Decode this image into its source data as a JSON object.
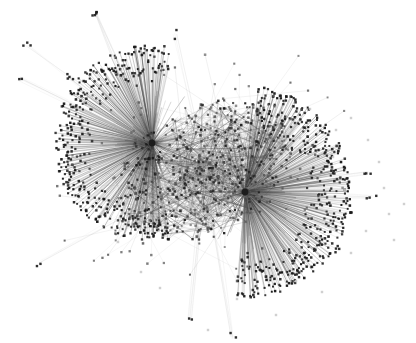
{
  "figure": {
    "name": "network-graph-visualization",
    "type": "force-directed-node-link-graph",
    "width": 416,
    "height": 343,
    "background_color": "#ffffff",
    "title": "",
    "caption": "",
    "axis_visible": false,
    "legend_visible": false,
    "labels_visible": false
  },
  "style": {
    "node_shape": "square",
    "node_color_core": "#1a1a1a",
    "node_color_mid": "#555555",
    "node_color_faint": "#c8c8c8",
    "edge_color_dark": "#3a3a3a",
    "edge_color_mid": "#8d8d8d",
    "edge_color_light": "#cfcfcf",
    "edge_width_min": 0.3,
    "edge_width_max": 0.75,
    "node_size_leaf": 1.9,
    "node_size_mid": 2.4,
    "node_size_hub": 3.4,
    "opacity_edge": 0.55
  },
  "chart_data": {
    "type": "scatter",
    "title": "",
    "xlabel": "",
    "ylabel": "",
    "xlim": [
      0,
      416
    ],
    "ylim": [
      0,
      343
    ],
    "grid": false,
    "legend_position": "none",
    "hubs": [
      {
        "id": "hub-a",
        "x": 152,
        "y": 143,
        "degree": 360,
        "fan_start_deg": 78,
        "fan_end_deg": 282,
        "fan_radius_min": 58,
        "fan_radius_max": 98
      },
      {
        "id": "hub-b",
        "x": 245,
        "y": 192,
        "degree": 400,
        "fan_start_deg": -84,
        "fan_end_deg": 96,
        "fan_radius_min": 58,
        "fan_radius_max": 106
      }
    ],
    "core": {
      "center_x": 205,
      "center_y": 170,
      "radius_x": 92,
      "radius_y": 66,
      "rotation_deg": -26,
      "node_count": 520,
      "edge_count": 900
    },
    "peripheral_clusters": [
      {
        "x": 26,
        "y": 44,
        "count": 3,
        "spoke_from": "hub-a"
      },
      {
        "x": 96,
        "y": 14,
        "count": 5,
        "spoke_from": "hub-a"
      },
      {
        "x": 20,
        "y": 78,
        "count": 2,
        "spoke_from": "hub-a"
      },
      {
        "x": 69,
        "y": 77,
        "count": 4,
        "spoke_from": "hub-a"
      },
      {
        "x": 175,
        "y": 35,
        "count": 2,
        "spoke_from": "core"
      },
      {
        "x": 38,
        "y": 264,
        "count": 2,
        "spoke_from": "core"
      },
      {
        "x": 190,
        "y": 320,
        "count": 2,
        "spoke_from": "core"
      },
      {
        "x": 232,
        "y": 338,
        "count": 2,
        "spoke_from": "core"
      },
      {
        "x": 300,
        "y": 273,
        "count": 3,
        "spoke_from": "hub-b"
      },
      {
        "x": 338,
        "y": 250,
        "count": 4,
        "spoke_from": "hub-b"
      },
      {
        "x": 368,
        "y": 173,
        "count": 3,
        "spoke_from": "hub-b"
      },
      {
        "x": 372,
        "y": 196,
        "count": 3,
        "spoke_from": "hub-b"
      },
      {
        "x": 352,
        "y": 213,
        "count": 3,
        "spoke_from": "hub-b"
      }
    ],
    "isolated_nodes": [
      {
        "x": 351,
        "y": 118
      },
      {
        "x": 368,
        "y": 140
      },
      {
        "x": 336,
        "y": 130
      },
      {
        "x": 333,
        "y": 157
      },
      {
        "x": 379,
        "y": 162
      },
      {
        "x": 300,
        "y": 138
      },
      {
        "x": 310,
        "y": 109
      },
      {
        "x": 389,
        "y": 214
      },
      {
        "x": 366,
        "y": 231
      },
      {
        "x": 394,
        "y": 240
      },
      {
        "x": 351,
        "y": 253
      },
      {
        "x": 322,
        "y": 292
      },
      {
        "x": 296,
        "y": 281
      },
      {
        "x": 276,
        "y": 315
      },
      {
        "x": 237,
        "y": 299
      },
      {
        "x": 141,
        "y": 272
      },
      {
        "x": 118,
        "y": 242
      },
      {
        "x": 160,
        "y": 288
      },
      {
        "x": 208,
        "y": 330
      },
      {
        "x": 263,
        "y": 262
      },
      {
        "x": 384,
        "y": 188
      },
      {
        "x": 404,
        "y": 204
      },
      {
        "x": 345,
        "y": 190
      },
      {
        "x": 318,
        "y": 226
      }
    ],
    "density_profile": {
      "white_margin_left_pct": 10,
      "white_margin_right_pct": 18,
      "white_margin_top_pct": 8,
      "white_margin_bottom_pct": 12,
      "darkest_regions": [
        "hub-a",
        "hub-b",
        "core"
      ]
    }
  }
}
